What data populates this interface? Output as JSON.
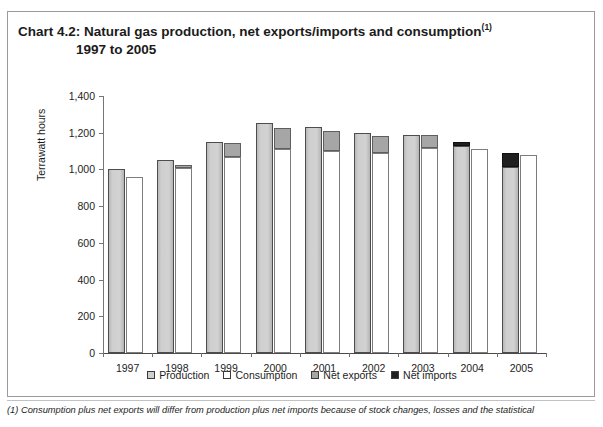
{
  "bleed": {
    "top_text_fragment": ""
  },
  "chart": {
    "title_line1": "Chart 4.2: Natural gas production, net exports/imports and consumption",
    "title_superscript": "(1)",
    "title_line2": "1997 to 2005"
  },
  "footnote": {
    "text": "(1) Consumption plus net exports will differ from production plus net imports because of stock changes, losses and the statistical"
  },
  "legend": {
    "items": [
      {
        "label": "Production",
        "color": "#cfcfcf"
      },
      {
        "label": "Consumption",
        "color": "#ffffff"
      },
      {
        "label": "Net exports",
        "color": "#a6a6a6"
      },
      {
        "label": "Net imports",
        "color": "#1f1f1f"
      }
    ]
  },
  "chart_data": {
    "type": "bar",
    "xlabel": "",
    "ylabel": "Terrawatt hours",
    "ylim": [
      0,
      1400
    ],
    "ytick_labels": [
      "1,400",
      "1,200",
      "1,000",
      "800",
      "600",
      "400",
      "200",
      "0"
    ],
    "ytick_values": [
      1400,
      1200,
      1000,
      800,
      600,
      400,
      200,
      0
    ],
    "grid": false,
    "legend_position": "bottom-center",
    "categories": [
      "1997",
      "1998",
      "1999",
      "2000",
      "2001",
      "2002",
      "2003",
      "2004",
      "2005"
    ],
    "series": [
      {
        "name": "Production",
        "values": [
          1000,
          1050,
          1150,
          1255,
          1230,
          1200,
          1190,
          1130,
          1015
        ]
      },
      {
        "name": "Consumption",
        "values": [
          960,
          1010,
          1070,
          1110,
          1100,
          1090,
          1115,
          1110,
          1080
        ]
      },
      {
        "name": "Net exports",
        "values": [
          0,
          15,
          75,
          115,
          110,
          90,
          70,
          0,
          0
        ]
      },
      {
        "name": "Net imports",
        "values": [
          0,
          0,
          0,
          0,
          0,
          0,
          0,
          20,
          75
        ]
      }
    ]
  }
}
